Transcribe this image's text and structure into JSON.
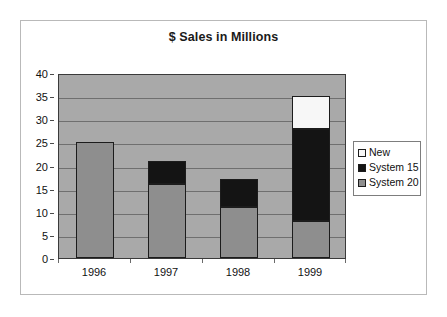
{
  "chart_data": {
    "type": "bar",
    "subtype": "stacked-column",
    "title": "$ Sales in Millions",
    "xlabel": "",
    "ylabel": "",
    "categories": [
      "1996",
      "1997",
      "1998",
      "1999"
    ],
    "series": [
      {
        "name": "System 20",
        "color": "#8e8e8e",
        "values": [
          25,
          16,
          11,
          8
        ]
      },
      {
        "name": "System 15",
        "color": "#141414",
        "values": [
          0,
          5,
          6,
          20
        ]
      },
      {
        "name": "New",
        "color": "#f7f7f7",
        "values": [
          0,
          0,
          0,
          7
        ]
      }
    ],
    "stack_totals": [
      25,
      21,
      17,
      35
    ],
    "ylim": [
      0,
      40
    ],
    "ytick_step": 5,
    "yticks": [
      "0",
      "5",
      "10",
      "15",
      "20",
      "25",
      "30",
      "35",
      "40"
    ],
    "grid": true,
    "grid_axis": "y",
    "legend_position": "right",
    "legend_entries": [
      "New",
      "System 15",
      "System 20"
    ],
    "plot_background": "#a9a9a9"
  },
  "legend": {
    "items": [
      {
        "label": "New",
        "swatch": "#f7f7f7"
      },
      {
        "label": "System 15",
        "swatch": "#141414"
      },
      {
        "label": "System 20",
        "swatch": "#8e8e8e"
      }
    ]
  }
}
